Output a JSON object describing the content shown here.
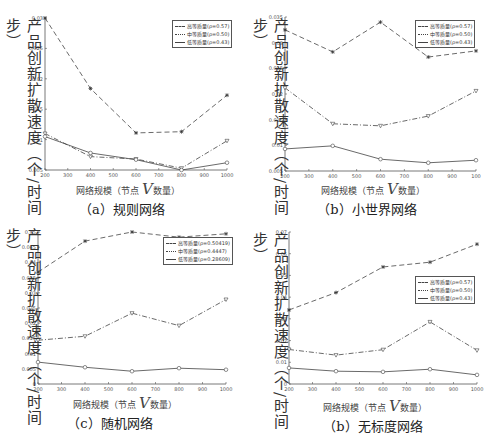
{
  "figure": {
    "common": {
      "ylabel": "产品创新扩散速度（个/时间步）",
      "xlabel_prefix": "网络规模（节点",
      "xlabel_var": "V",
      "xlabel_suffix": "数量）"
    },
    "panels": [
      {
        "caption": "（a）规则网络",
        "legend": [
          "高等质量(ρ=0.57)",
          "中等质量(ρ=0.50)",
          "低等质量(ρ=0.43)"
        ]
      },
      {
        "caption": "（b）小世界网络",
        "legend": [
          "高等质量(ρ=0.57)",
          "中等质量(ρ=0.50)",
          "低等质量(ρ=0.43)"
        ]
      },
      {
        "caption": "（c）随机网络",
        "legend": [
          "高等质量(ρ=0.50419)",
          "中等质量(ρ=0.4447)",
          "低等质量(ρ=0.28609)"
        ]
      },
      {
        "caption": "（b）无标度网络",
        "legend": [
          "高等质量(ρ=0.57)",
          "中等质量(ρ=0.50)",
          "低等质量(ρ=0.43)"
        ]
      }
    ]
  },
  "chart_data": [
    {
      "type": "line",
      "title": "（a）规则网络",
      "xlabel": "网络规模（节点V数量）",
      "ylabel": "产品创新扩散速度（个/时间步）",
      "x": [
        200,
        400,
        600,
        800,
        1000
      ],
      "xticks": [
        "200",
        "300",
        "400",
        "500",
        "600",
        "700",
        "800",
        "900",
        "1000"
      ],
      "yticks": [
        "0.005",
        "0.01",
        "0.015",
        "0.02",
        "0.025",
        "0.03"
      ],
      "ylim": [
        0.005,
        0.03
      ],
      "xlim": [
        200,
        1000
      ],
      "legend_position": "upper right",
      "series": [
        {
          "name": "高等质量(ρ=0.57)",
          "style": "dashed, asterisk",
          "values": [
            0.03,
            0.0184,
            0.0111,
            0.0113,
            0.0173
          ]
        },
        {
          "name": "中等质量(ρ=0.50)",
          "style": "dashdot, triangle-down",
          "values": [
            0.011,
            0.0072,
            0.0068,
            0.0053,
            0.0098
          ]
        },
        {
          "name": "低等质量(ρ=0.43)",
          "style": "solid, circle",
          "values": [
            0.0105,
            0.0078,
            0.0067,
            0.005,
            0.0062
          ]
        }
      ]
    },
    {
      "type": "line",
      "title": "（b）小世界网络",
      "xlabel": "网络规模（节点V数量）",
      "ylabel": "产品创新扩散速度（个/时间步）",
      "x": [
        200,
        400,
        600,
        800,
        1000
      ],
      "xticks": [
        "200",
        "300",
        "400",
        "500",
        "600",
        "700",
        "800",
        "900",
        "100"
      ],
      "yticks": [
        "0.005",
        "0.01",
        "0.015",
        "0.02",
        "0.025",
        "0.03",
        "0.035"
      ],
      "ylim": [
        0.005,
        0.035
      ],
      "xlim": [
        200,
        1000
      ],
      "legend_position": "upper right",
      "series": [
        {
          "name": "高等质量(ρ=0.57)",
          "style": "dashed, asterisk",
          "values": [
            0.0325,
            0.0282,
            0.034,
            0.0272,
            0.0284
          ]
        },
        {
          "name": "中等质量(ρ=0.50)",
          "style": "dashdot, triangle-down",
          "values": [
            0.0212,
            0.0142,
            0.0138,
            0.0157,
            0.0206
          ]
        },
        {
          "name": "低等质量(ρ=0.43)",
          "style": "solid, circle",
          "values": [
            0.0093,
            0.0099,
            0.0073,
            0.0066,
            0.0071
          ]
        }
      ]
    },
    {
      "type": "line",
      "title": "（c）随机网络",
      "xlabel": "网络规模（节点V数量）",
      "ylabel": "产品创新扩散速度（个/时间步）",
      "x": [
        200,
        400,
        600,
        800,
        1000
      ],
      "xticks": [
        "200",
        "300",
        "400",
        "500",
        "600",
        "700",
        "800",
        "900",
        "1000"
      ],
      "yticks": [
        "0",
        "0.005",
        "0.01",
        "0.015",
        "0.02",
        "0.025",
        "0.03",
        "0.035",
        "0.04",
        "0.045",
        "0.05"
      ],
      "ylim": [
        0,
        0.05
      ],
      "xlim": [
        200,
        1000
      ],
      "legend_position": "upper right",
      "series": [
        {
          "name": "高等质量(ρ=0.50419)",
          "style": "dashed, asterisk",
          "values": [
            0.0368,
            0.047,
            0.05,
            0.0483,
            0.0494
          ]
        },
        {
          "name": "中等质量(ρ=0.4447)",
          "style": "dashdot, triangle-down",
          "values": [
            0.0144,
            0.0157,
            0.0233,
            0.0192,
            0.0278
          ]
        },
        {
          "name": "低等质量(ρ=0.28609)",
          "style": "solid, circle",
          "values": [
            0.0072,
            0.0055,
            0.0042,
            0.0052,
            0.0047
          ]
        }
      ]
    },
    {
      "type": "line",
      "title": "（b）无标度网络",
      "xlabel": "网络规模（节点V数量）",
      "ylabel": "产品创新扩散速度（个/时间步）",
      "x": [
        200,
        400,
        600,
        800,
        1000
      ],
      "xticks": [
        "200",
        "300",
        "400",
        "500",
        "600",
        "700",
        "800",
        "900",
        "1000"
      ],
      "yticks": [
        "0",
        "0.01",
        "0.02",
        "0.03",
        "0.04",
        "0.05",
        "0.06",
        "0.07"
      ],
      "ylim": [
        0,
        0.07
      ],
      "xlim": [
        200,
        1000
      ],
      "legend_position": "center right",
      "series": [
        {
          "name": "高等质量(ρ=0.57)",
          "style": "dashed, asterisk",
          "values": [
            0.0341,
            0.0421,
            0.0539,
            0.0561,
            0.0644
          ]
        },
        {
          "name": "中等质量(ρ=0.50)",
          "style": "dashdot, triangle-down",
          "values": [
            0.0159,
            0.0133,
            0.0158,
            0.0286,
            0.0155
          ]
        },
        {
          "name": "低等质量(ρ=0.43)",
          "style": "solid, circle",
          "values": [
            0.0074,
            0.0059,
            0.0056,
            0.0068,
            0.0042
          ]
        }
      ]
    }
  ]
}
